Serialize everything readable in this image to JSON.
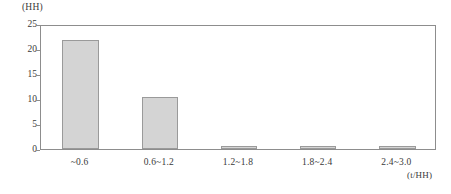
{
  "chart_data": {
    "type": "bar",
    "title": "",
    "subtitle": "",
    "categories": [
      "~0.6",
      "0.6~1.2",
      "1.2~1.8",
      "1.8~2.4",
      "2.4~3.0"
    ],
    "values": [
      21.8,
      10.4,
      0.6,
      0.6,
      0.6
    ],
    "series": [
      {
        "name": "",
        "values": [
          21.8,
          10.4,
          0.6,
          0.6,
          0.6
        ]
      }
    ],
    "xlabel": "(t/HH)",
    "ylabel": "(HH)",
    "ylim": [
      0,
      25
    ],
    "yticks": [
      0,
      5,
      10,
      15,
      20,
      25
    ],
    "ytick_labels": [
      "0",
      "5",
      "10",
      "15",
      "20",
      "25"
    ],
    "grid": false,
    "legend": false,
    "legend_position": "none",
    "bar_color": "#d4d4d4",
    "bar_border_color": "#9a9a9a",
    "axis_color": "#8d8d8d",
    "text_color": "#3a3a3a"
  }
}
